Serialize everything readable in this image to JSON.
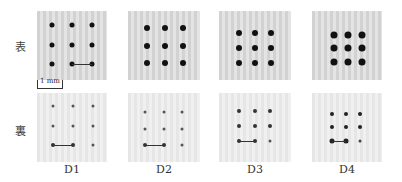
{
  "rows": [
    {
      "label": "表",
      "side": "front"
    },
    {
      "label": "裏",
      "side": "back"
    }
  ],
  "columns": [
    {
      "label": "D1"
    },
    {
      "label": "D2"
    },
    {
      "label": "D3"
    },
    {
      "label": "D4"
    }
  ],
  "scale_bar": {
    "label": "1 mm"
  },
  "colors": {
    "dot": "#111111",
    "panel_front": "#d2d2d2",
    "panel_back": "#e6e6e6"
  }
}
